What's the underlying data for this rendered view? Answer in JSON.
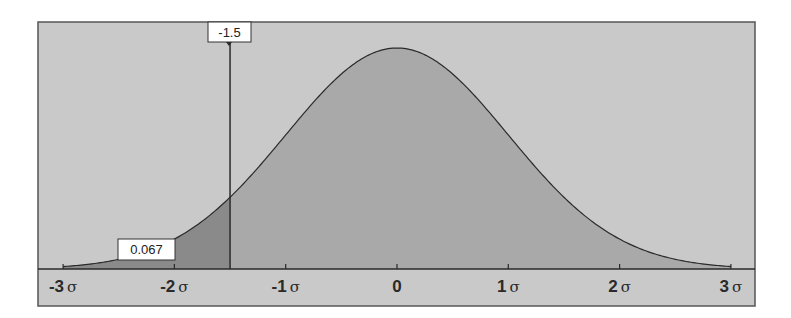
{
  "chart_data": {
    "type": "area",
    "title": "",
    "xlabel": "",
    "ylabel": "",
    "x_range": [
      -3.3,
      3.1
    ],
    "tick_labels": [
      "-3σ",
      "-2σ",
      "-1σ",
      "0",
      "1σ",
      "2σ",
      "3σ"
    ],
    "tick_values": [
      -3,
      -2,
      -1,
      0,
      1,
      2,
      3
    ],
    "marker": {
      "x": -1.5,
      "label": "-1.5"
    },
    "tail_area": {
      "from": -3,
      "to": -1.5,
      "value": 0.067,
      "label": "0.067"
    },
    "grid": false,
    "legend": null
  },
  "colors": {
    "background": "#c9c9c9",
    "curve_fill": "#a9a9a9",
    "tail_fill": "#8a8a8a",
    "line": "#2a2a2a",
    "label_box": "#ffffff"
  },
  "axis": {
    "ticks": [
      {
        "num": "-3",
        "sym": "σ"
      },
      {
        "num": "-2",
        "sym": "σ"
      },
      {
        "num": "-1",
        "sym": "σ"
      },
      {
        "num": "0",
        "sym": ""
      },
      {
        "num": "1",
        "sym": "σ"
      },
      {
        "num": "2",
        "sym": "σ"
      },
      {
        "num": "3",
        "sym": "σ"
      }
    ]
  },
  "labels": {
    "marker": "-1.5",
    "tail": "0.067"
  }
}
